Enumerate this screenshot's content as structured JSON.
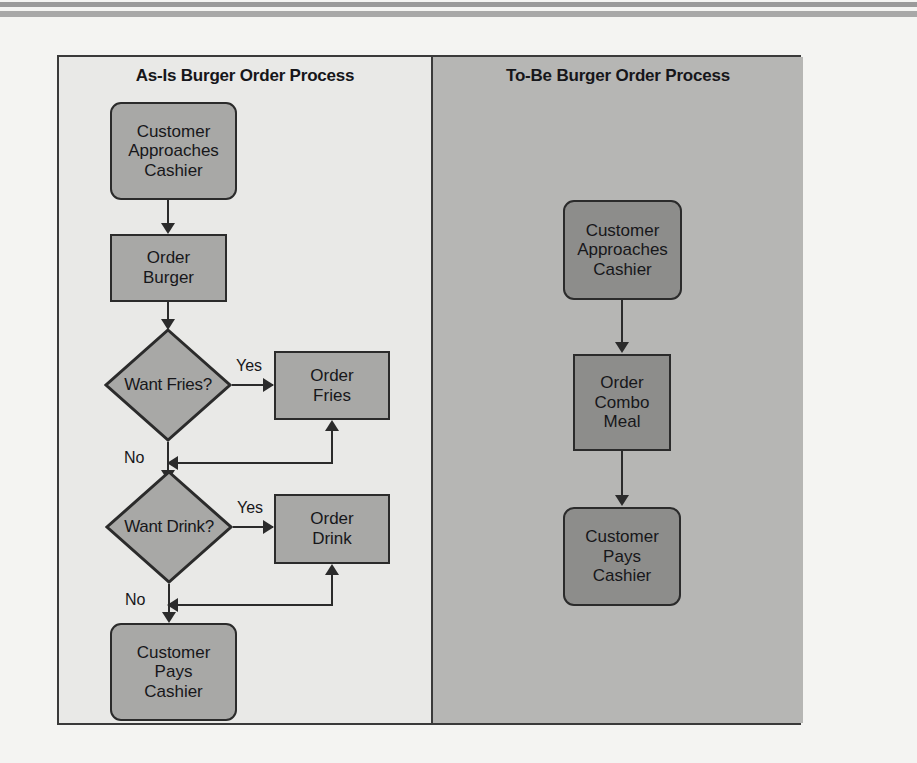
{
  "figure": {
    "background_color": "#f4f4f2",
    "frame_border_color": "#3a3a3a",
    "node_fill_light": "#a8a8a6",
    "node_fill_dark": "#8d8d8b",
    "panel_left_bg": "#e9e9e7",
    "panel_right_bg": "#b6b6b4",
    "connector_color": "#2b2b2b"
  },
  "panels": [
    {
      "id": "as-is",
      "title": "As-Is Burger Order Process",
      "nodes": [
        {
          "id": "as-is-customer-approaches",
          "shape": "rounded-rect",
          "label": "Customer\nApproaches\nCashier"
        },
        {
          "id": "as-is-order-burger",
          "shape": "rect",
          "label": "Order\nBurger"
        },
        {
          "id": "as-is-want-fries",
          "shape": "diamond",
          "label": "Want Fries?"
        },
        {
          "id": "as-is-order-fries",
          "shape": "rect",
          "label": "Order\nFries"
        },
        {
          "id": "as-is-want-drink",
          "shape": "diamond",
          "label": "Want Drink?"
        },
        {
          "id": "as-is-order-drink",
          "shape": "rect",
          "label": "Order\nDrink"
        },
        {
          "id": "as-is-customer-pays",
          "shape": "rounded-rect",
          "label": "Customer\nPays\nCashier"
        }
      ],
      "edge_labels": {
        "fries_yes": "Yes",
        "fries_no": "No",
        "drink_yes": "Yes",
        "drink_no": "No"
      }
    },
    {
      "id": "to-be",
      "title": "To-Be Burger Order Process",
      "nodes": [
        {
          "id": "to-be-customer-approaches",
          "shape": "rounded-rect",
          "label": "Customer\nApproaches\nCashier"
        },
        {
          "id": "to-be-order-combo-meal",
          "shape": "rect",
          "label": "Order\nCombo\nMeal"
        },
        {
          "id": "to-be-customer-pays",
          "shape": "rounded-rect",
          "label": "Customer\nPays\nCashier"
        }
      ],
      "edge_labels": {}
    }
  ]
}
